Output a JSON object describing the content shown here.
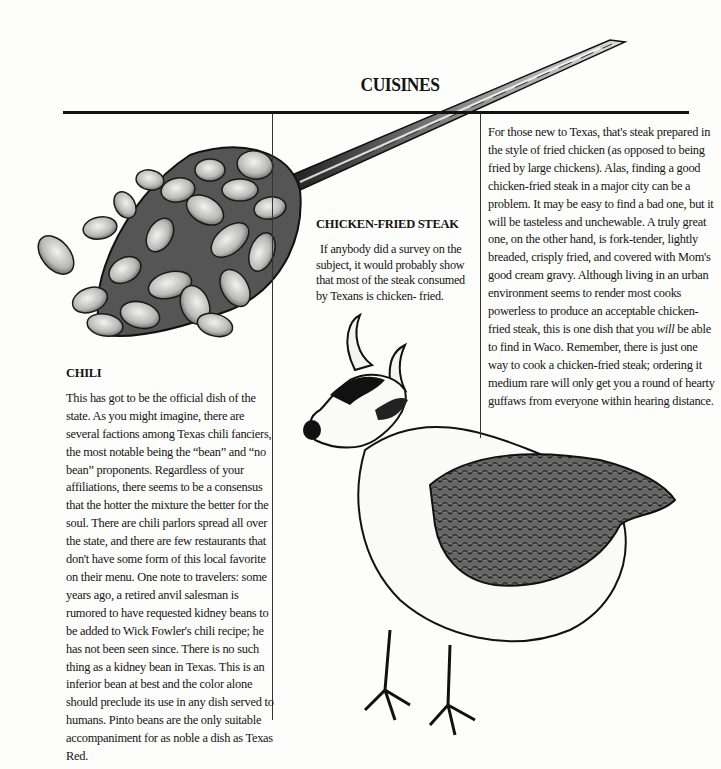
{
  "page": {
    "title": "CUISINES"
  },
  "sections": {
    "chicken_fried_steak": {
      "heading": "CHICKEN-FRIED STEAK",
      "intro": "If anybody did a survey on the subject, it would probably show that most of the steak consumed by Texans is chicken- fried.",
      "body_part1": "For those new to Texas, that's steak prepared in the style of fried chicken (as opposed to being fried by large chickens). Alas, finding a good chicken-fried steak in a major city can be a problem. It may be easy to find a bad one, but it will be tasteless and unchewable. A truly great one, on the other hand, is fork-tender, lightly breaded, crisply fried, and covered with Mom's good cream gravy. Although living in an urban environment seems to render most cooks powerless to produce an acceptable chicken-fried steak, this is one dish that you ",
      "body_emphasis": "will",
      "body_part2": " be able to find in Waco. Remember, there is just one way to cook a chicken-fried steak; ordering it medium rare will only get you a round of hearty guffaws from everyone within hearing distance."
    },
    "chili": {
      "heading": "CHILI",
      "body": "This has got to be the official dish of the state. As you might imagine, there are several factions among Texas chili fanciers, the most notable being the “bean” and “no bean” proponents. Regardless of your affiliations, there seems to be a consensus that the hotter the mixture the better for the soul. There are chili parlors spread all over the state, and there are few restaurants that don't have some form of this local favorite on their menu. One note to travelers: some years ago, a retired anvil salesman is rumored to have requested kidney beans to be added to Wick Fowler's chili recipe; he has not been seen since. There is no such thing as a kidney bean in Texas. This is an inferior bean at best and the color alone should preclude its use in any dish served to humans. Pinto beans are the only suitable accompaniment for as noble a dish as Texas Red."
    }
  },
  "illustrations": {
    "spoon": "spoon of beans illustration",
    "creature": "cow-headed chicken illustration"
  }
}
